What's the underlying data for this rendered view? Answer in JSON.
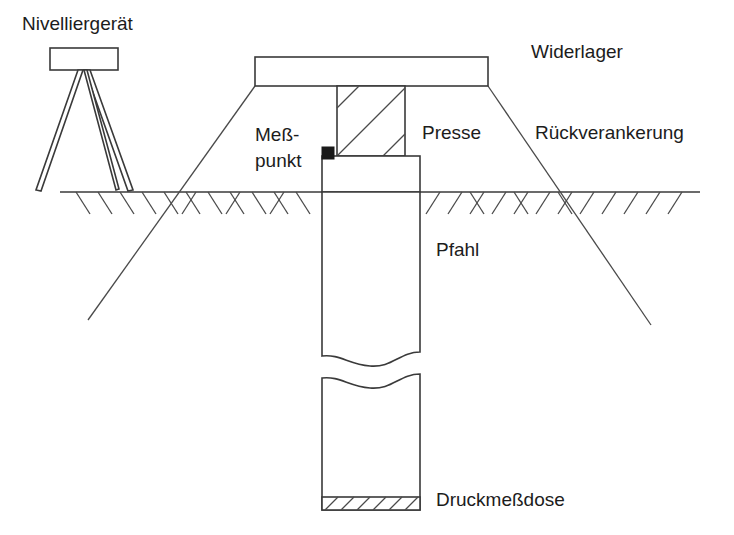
{
  "diagram": {
    "background_color": "#ffffff",
    "line_color": "#3a3a3a",
    "text_color": "#1c1c1c",
    "marker_color": "#1a1a1a",
    "labels": {
      "leveling_instrument": "Nivelliergerät",
      "abutment": "Widerlager",
      "back_anchorage": "Rückverankerung",
      "measuring_point_line1": "Meß-",
      "measuring_point_line2": "punkt",
      "press": "Presse",
      "pile": "Pfahl",
      "pressure_cell": "Druckmeßdose"
    },
    "label_positions": {
      "leveling_instrument": {
        "x": 22,
        "y": 30
      },
      "abutment": {
        "x": 531,
        "y": 58
      },
      "back_anchorage": {
        "x": 535,
        "y": 139
      },
      "measuring_point_line1": {
        "x": 255,
        "y": 141
      },
      "measuring_point_line2": {
        "x": 255,
        "y": 167
      },
      "press": {
        "x": 422,
        "y": 139
      },
      "pile": {
        "x": 436,
        "y": 256
      },
      "pressure_cell": {
        "x": 436,
        "y": 506
      }
    },
    "geometry": {
      "ground_line": {
        "x1": 60,
        "y1": 192,
        "x2": 700,
        "y2": 192
      },
      "instrument_box": {
        "x": 50,
        "y": 48,
        "width": 68,
        "height": 22
      },
      "tripod_apex": {
        "x": 84,
        "y": 72
      },
      "tripod_foot_left": {
        "x": 36,
        "y": 190
      },
      "tripod_foot_right": {
        "x": 133,
        "y": 190
      },
      "abutment_beam": {
        "x": 255,
        "y": 57,
        "width": 233,
        "height": 29
      },
      "press_block": {
        "x": 337,
        "y": 86,
        "width": 68,
        "height": 70
      },
      "press_hatch_count": 3,
      "pile_head": {
        "x": 322,
        "y": 156,
        "width": 98,
        "height": 36
      },
      "pile_shaft_top": {
        "x": 322,
        "y": 192,
        "width": 98,
        "height": 165
      },
      "pile_shaft_bottom": {
        "x": 322,
        "y": 375,
        "width": 98,
        "height": 135
      },
      "break_gap": {
        "top_y": 357,
        "bottom_y": 378
      },
      "pressure_cell_band": {
        "x": 322,
        "y": 497,
        "width": 98,
        "height": 13
      },
      "pressure_cell_hatch_count": 6,
      "anchor_left": {
        "x1": 255,
        "y1": 86,
        "x2": 88,
        "y2": 320
      },
      "anchor_right": {
        "x1": 488,
        "y1": 86,
        "x2": 651,
        "y2": 325
      },
      "ground_hatch_left": {
        "from_x": 70,
        "to_x": 318,
        "count": 11
      },
      "ground_hatch_right": {
        "from_x": 424,
        "to_x": 694,
        "count": 12
      },
      "hatch_length": 22
    }
  }
}
